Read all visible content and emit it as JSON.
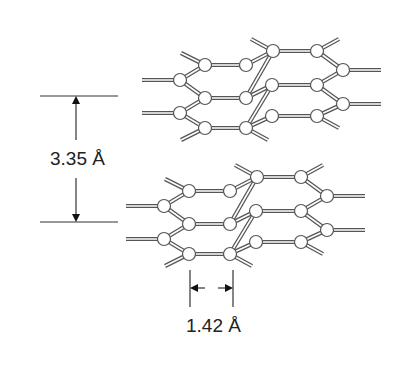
{
  "diagram": {
    "interlayer_spacing_label": "3.35 Å",
    "bond_length_label": "1.42 Å",
    "colors": {
      "line": "#555555",
      "bond_fill": "#ffffff",
      "atom_fill": "#ffffff"
    }
  }
}
